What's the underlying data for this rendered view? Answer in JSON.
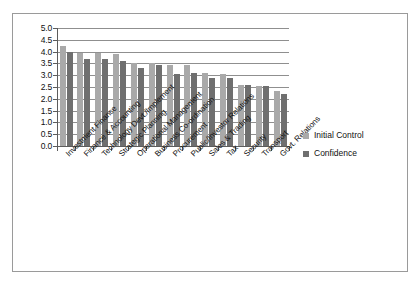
{
  "chart_data": {
    "type": "bar",
    "title": "",
    "subtitle": "",
    "xlabel": "",
    "ylabel": "",
    "ylim": [
      0.0,
      5.0
    ],
    "grid": true,
    "legend_position": "right",
    "orientation": "vertical",
    "grouping": "grouped",
    "y_ticks": [
      "5.0",
      "4.5",
      "4.0",
      "3.5",
      "3.0",
      "2.5",
      "2.0",
      "1.5",
      "1.0",
      "0.5",
      "0.0"
    ],
    "y_tick_values": [
      5.0,
      4.5,
      4.0,
      3.5,
      3.0,
      2.5,
      2.0,
      1.5,
      1.0,
      0.5,
      0.0
    ],
    "categories": [
      "Investment Finance",
      "Finance & Accounting",
      "Technology Devt./Implement",
      "Strategic Planning",
      "Operational Management",
      "Business Co-ordination",
      "Procurement",
      "Public/Investor Relations",
      "Sales & Trading",
      "Tax",
      "Security",
      "Transport",
      "Govt. Relations"
    ],
    "series": [
      {
        "name": "Initial Control",
        "color": "#a9a9a9",
        "values": [
          4.25,
          3.95,
          3.95,
          3.9,
          3.5,
          3.5,
          3.45,
          3.45,
          3.1,
          3.05,
          2.6,
          2.55,
          2.35
        ]
      },
      {
        "name": "Confidence",
        "color": "#6f6f6f",
        "values": [
          4.0,
          3.7,
          3.7,
          3.6,
          3.3,
          3.45,
          3.05,
          3.1,
          2.9,
          2.9,
          2.6,
          2.55,
          2.2
        ]
      }
    ]
  },
  "legend": {
    "items": [
      {
        "label": "Initial Control",
        "color": "#a9a9a9"
      },
      {
        "label": "Confidence",
        "color": "#6f6f6f"
      }
    ]
  },
  "colors": {
    "initial_control": "#a9a9a9",
    "confidence": "#6f6f6f",
    "gridline": "#8f8f8f",
    "axis": "#5c5c5c",
    "border": "#9a9a9a",
    "background": "#ffffff",
    "text": "#111111"
  }
}
